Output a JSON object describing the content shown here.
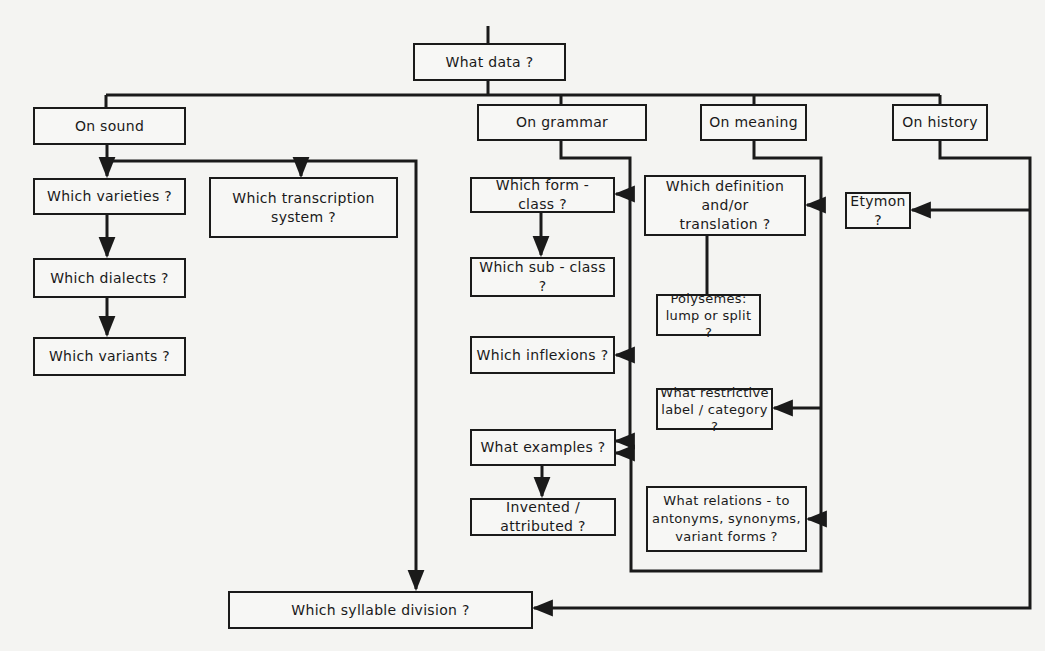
{
  "diagram": {
    "type": "flowchart",
    "root": {
      "label": "What data ?"
    },
    "branches": [
      {
        "label": "On sound",
        "children": [
          {
            "label": "Which varieties ?"
          },
          {
            "label": "Which transcription system ?"
          },
          {
            "label": "Which dialects ?"
          },
          {
            "label": "Which variants ?"
          },
          {
            "label": "Which syllable division ?"
          }
        ]
      },
      {
        "label": "On grammar",
        "children": [
          {
            "label": "Which form - class ?"
          },
          {
            "label": "Which sub - class ?"
          },
          {
            "label": "Which inflexions ?"
          },
          {
            "label": "What examples ?"
          },
          {
            "label": "Invented / attributed ?"
          }
        ]
      },
      {
        "label": "On meaning",
        "children": [
          {
            "label": "Which definition and/or translation ?"
          },
          {
            "label": "Polysemes: lump or split ?"
          },
          {
            "label": "What restrictive label / category ?"
          },
          {
            "label": "What relations - to antonyms, synonyms, variant forms ?"
          }
        ]
      },
      {
        "label": "On history",
        "children": [
          {
            "label": "Etymon ?"
          }
        ]
      }
    ],
    "colors": {
      "line": "#1a1a1a",
      "background": "#f4f4f2"
    }
  },
  "nodes": {
    "what_data": "What data ?",
    "on_sound": "On sound",
    "on_grammar": "On grammar",
    "on_meaning": "On meaning",
    "on_history": "On history",
    "varieties": "Which varieties ?",
    "transcription_1": "Which transcription",
    "transcription_2": "system ?",
    "dialects": "Which dialects ?",
    "variants": "Which variants ?",
    "syllable": "Which syllable division ?",
    "form_class": "Which form - class ?",
    "sub_class": "Which sub - class ?",
    "inflexions": "Which inflexions ?",
    "examples": "What examples ?",
    "invented": "Invented / attributed ?",
    "definition_1": "Which definition and/or",
    "definition_2": "translation ?",
    "polysemes_1": "Polysemes:",
    "polysemes_2": "lump or split ?",
    "restrictive_1": "What restrictive",
    "restrictive_2": "label / category ?",
    "relations_1": "What relations - to",
    "relations_2": "antonyms, synonyms,",
    "relations_3": "variant forms ?",
    "etymon": "Etymon ?"
  }
}
